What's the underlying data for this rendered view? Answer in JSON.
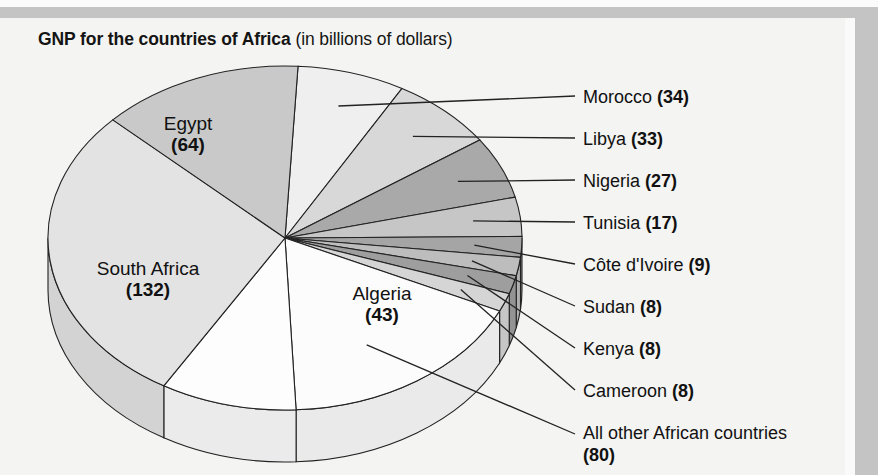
{
  "title": {
    "bold": "GNP for the countries of Africa",
    "normal": " (in billions of dollars)"
  },
  "chart_data": {
    "type": "pie",
    "title": "GNP for the countries of Africa (in billions of dollars)",
    "unit": "billions of dollars",
    "total": 463,
    "categories": [
      "South Africa",
      "All other African countries",
      "Egypt",
      "Algeria",
      "Morocco",
      "Libya",
      "Nigeria",
      "Tunisia",
      "Côte d'Ivoire",
      "Sudan",
      "Kenya",
      "Cameroon"
    ],
    "values": [
      132,
      80,
      64,
      43,
      34,
      33,
      27,
      17,
      9,
      8,
      8,
      8
    ],
    "legend": "none",
    "grid": false,
    "slices": [
      {
        "name": "South Africa",
        "value": 132,
        "label": "South Africa",
        "value_text": "(132)",
        "color": "#e3e3e3",
        "label_type": "inside"
      },
      {
        "name": "All other African countries",
        "value": 80,
        "label": "All other African countries",
        "value_text": "(80)",
        "color": "#fcfcfc",
        "label_type": "callout"
      },
      {
        "name": "Egypt",
        "value": 64,
        "label": "Egypt",
        "value_text": "(64)",
        "color": "#c9c9c9",
        "label_type": "inside"
      },
      {
        "name": "Algeria",
        "value": 43,
        "label": "Algeria",
        "value_text": "(43)",
        "color": "#fdfdfd",
        "label_type": "inside"
      },
      {
        "name": "Morocco",
        "value": 34,
        "label": "Morocco",
        "value_text": "(34)",
        "color": "#efefef",
        "label_type": "callout"
      },
      {
        "name": "Libya",
        "value": 33,
        "label": "Libya",
        "value_text": "(33)",
        "color": "#d8d8d8",
        "label_type": "callout"
      },
      {
        "name": "Nigeria",
        "value": 27,
        "label": "Nigeria",
        "value_text": "(27)",
        "color": "#a9a9a9",
        "label_type": "callout"
      },
      {
        "name": "Tunisia",
        "value": 17,
        "label": "Tunisia",
        "value_text": "(17)",
        "color": "#c6c6c6",
        "label_type": "callout"
      },
      {
        "name": "Côte d'Ivoire",
        "value": 9,
        "label": "Côte d'Ivoire",
        "value_text": "(9)",
        "color": "#a5a5a5",
        "label_type": "callout"
      },
      {
        "name": "Sudan",
        "value": 8,
        "label": "Sudan",
        "value_text": "(8)",
        "color": "#bdbdbd",
        "label_type": "callout"
      },
      {
        "name": "Kenya",
        "value": 8,
        "label": "Kenya",
        "value_text": "(8)",
        "color": "#9e9e9e",
        "label_type": "callout"
      },
      {
        "name": "Cameroon",
        "value": 8,
        "label": "Cameroon",
        "value_text": "(8)",
        "color": "#d5d5d5",
        "label_type": "callout"
      }
    ]
  },
  "inside_labels": [
    {
      "name": "Egypt",
      "value_text": "(64)"
    },
    {
      "name": "South Africa",
      "value_text": "(132)"
    },
    {
      "name": "Algeria",
      "value_text": "(43)"
    }
  ],
  "callouts": [
    {
      "name": "Morocco",
      "value_text": "(34)"
    },
    {
      "name": "Libya",
      "value_text": "(33)"
    },
    {
      "name": "Nigeria",
      "value_text": "(27)"
    },
    {
      "name": "Tunisia",
      "value_text": "(17)"
    },
    {
      "name": "Côte d'Ivoire",
      "value_text": "(9)"
    },
    {
      "name": "Sudan",
      "value_text": "(8)"
    },
    {
      "name": "Kenya",
      "value_text": "(8)"
    },
    {
      "name": "Cameroon",
      "value_text": "(8)"
    },
    {
      "name": "All other African countries",
      "value_text": "(80)"
    }
  ],
  "colors": {
    "page_background": "#f4f4f2",
    "frame_band": "#c4c4c4",
    "text": "#111111",
    "slice_outline": "#222222"
  }
}
